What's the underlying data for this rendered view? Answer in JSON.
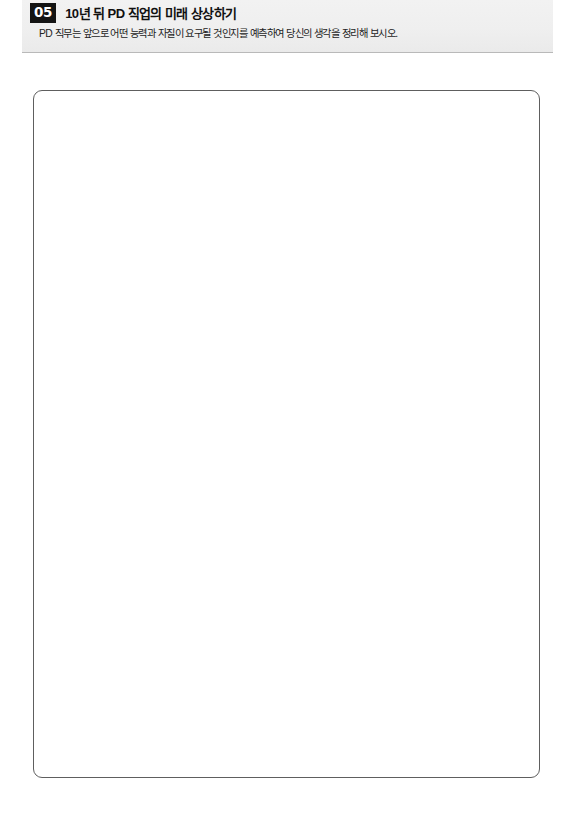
{
  "page": {
    "background_color": "#ffffff",
    "language": "ko"
  },
  "header": {
    "band_color": "#efefef",
    "rule_color": "#b9b9b9",
    "number": "05",
    "number_badge_background": "#141414",
    "number_badge_text_color": "#ffffff",
    "title": "10년 뒤 PD 직업의 미래 상상하기",
    "title_color": "#101010",
    "subtitle": "PD 직무는 앞으로 어떤 능력과 자질이 요구될 것인지를 예측하여 당신의 생각을 정리해 보시오.",
    "subtitle_color": "#232323"
  },
  "answer_area": {
    "placeholder": "",
    "value": "",
    "border_color": "#5e5e5e",
    "background_color": "#ffffff"
  }
}
